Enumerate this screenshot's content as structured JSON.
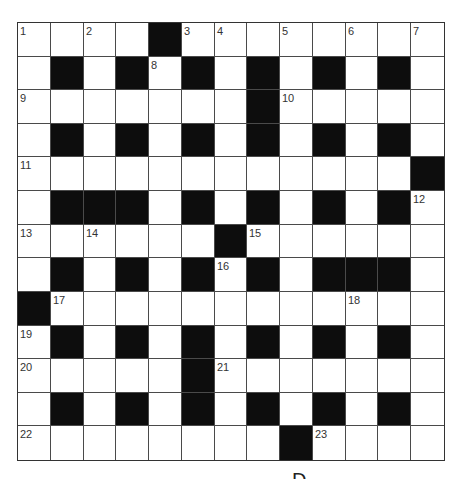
{
  "puzzle": {
    "type": "crossword",
    "rows": 13,
    "cols": 13,
    "layout": [
      "W W W W B W W W W W W W W",
      "W B W B W B W B W B W B W",
      "W W W W W W W B W W W W W",
      "W B W B W B W B W B W B W",
      "W W W W W W W W W W W W B",
      "W B B B W B W B W B W B W",
      "W W W W W W B W W W W W W",
      "W B W B W B W B W B B B W",
      "B W W W W W W W W W W W W",
      "W B W B W B W B W B W B W",
      "W W W W W B W W W W W W W",
      "W B W B W B W B W B W B W",
      "W W W W W W W W B W W W W"
    ],
    "numbers": [
      {
        "n": "1",
        "r": 0,
        "c": 0
      },
      {
        "n": "2",
        "r": 0,
        "c": 2
      },
      {
        "n": "3",
        "r": 0,
        "c": 5
      },
      {
        "n": "4",
        "r": 0,
        "c": 6
      },
      {
        "n": "5",
        "r": 0,
        "c": 8
      },
      {
        "n": "6",
        "r": 0,
        "c": 10
      },
      {
        "n": "7",
        "r": 0,
        "c": 12
      },
      {
        "n": "8",
        "r": 1,
        "c": 4
      },
      {
        "n": "9",
        "r": 2,
        "c": 0
      },
      {
        "n": "10",
        "r": 2,
        "c": 8
      },
      {
        "n": "11",
        "r": 4,
        "c": 0
      },
      {
        "n": "12",
        "r": 5,
        "c": 12
      },
      {
        "n": "13",
        "r": 6,
        "c": 0
      },
      {
        "n": "14",
        "r": 6,
        "c": 2
      },
      {
        "n": "15",
        "r": 6,
        "c": 7
      },
      {
        "n": "16",
        "r": 7,
        "c": 6
      },
      {
        "n": "17",
        "r": 8,
        "c": 1
      },
      {
        "n": "18",
        "r": 8,
        "c": 10
      },
      {
        "n": "19",
        "r": 9,
        "c": 0
      },
      {
        "n": "20",
        "r": 10,
        "c": 0
      },
      {
        "n": "21",
        "r": 10,
        "c": 6
      },
      {
        "n": "22",
        "r": 12,
        "c": 0
      },
      {
        "n": "23",
        "r": 12,
        "c": 9
      }
    ],
    "colors": {
      "cell_white": "#ffffff",
      "cell_black": "#0d0d0d",
      "grid_line": "#4a4a4a",
      "number_text": "#333333"
    }
  },
  "footer": {
    "partial_glyph": "D"
  }
}
